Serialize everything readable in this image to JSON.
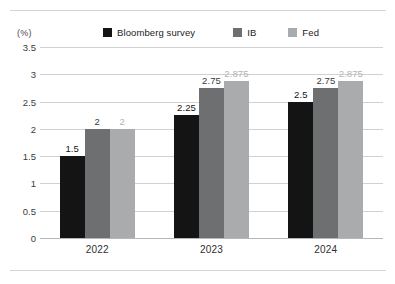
{
  "chart_data": {
    "type": "bar",
    "title": "",
    "subtitle": "",
    "xlabel": "",
    "ylabel": "(%)",
    "unit_label": "(%)",
    "categories": [
      "2022",
      "2023",
      "2024"
    ],
    "series": [
      {
        "name": "Bloomberg survey",
        "color": "#141414",
        "values": [
          1.5,
          2.25,
          2.5
        ],
        "labels": [
          "1.5",
          "2.25",
          "2.5"
        ]
      },
      {
        "name": "IB",
        "color": "#6d6f71",
        "values": [
          2,
          2.75,
          2.75
        ],
        "labels": [
          "2",
          "2.75",
          "2.75"
        ]
      },
      {
        "name": "Fed",
        "color": "#a9abad",
        "values": [
          2,
          2.875,
          2.875
        ],
        "labels": [
          "2",
          "2.875",
          "2.875"
        ]
      }
    ],
    "ylim": [
      0,
      3.5
    ],
    "yticks": [
      "0",
      "0.5",
      "1",
      "1.5",
      "2",
      "2.5",
      "3",
      "3.5"
    ],
    "ytick_values": [
      0,
      0.5,
      1,
      1.5,
      2,
      2.5,
      3,
      3.5
    ],
    "grid": true,
    "legend_position": "top-center",
    "label_colors": {
      "Bloomberg survey": "#141414",
      "IB": "#3a3a3a",
      "Fed": "#b2b4b6"
    }
  }
}
